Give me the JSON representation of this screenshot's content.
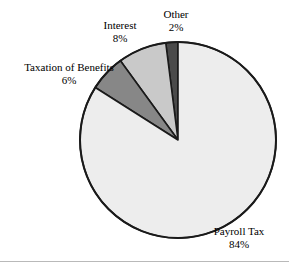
{
  "chart_data": {
    "type": "pie",
    "title": "",
    "subtitle": "",
    "xlabel": "",
    "ylabel": "",
    "legend_position": "none",
    "grid": false,
    "labels_outside": true,
    "start_angle_deg": 90,
    "direction": "counterclockwise",
    "categories": [
      "Other",
      "Interest",
      "Taxation of Benefits",
      "Payroll Tax"
    ],
    "values": [
      2,
      8,
      6,
      84
    ],
    "value_unit": "%",
    "slices": [
      {
        "name": "Other",
        "value": 2,
        "value_text": "2%",
        "color": "#4a4a4a",
        "start_deg": 90,
        "end_deg": 97.2
      },
      {
        "name": "Interest",
        "value": 8,
        "value_text": "8%",
        "color": "#c9c9c9",
        "start_deg": 97.2,
        "end_deg": 126.0
      },
      {
        "name": "Taxation of Benefits",
        "value": 6,
        "value_text": "6%",
        "color": "#878787",
        "start_deg": 126.0,
        "end_deg": 147.6
      },
      {
        "name": "Payroll Tax",
        "value": 84,
        "value_text": "84%",
        "color": "#ededed",
        "start_deg": 147.6,
        "end_deg": 450.0
      }
    ],
    "outline_color": "#1a1a1a",
    "background": "#ffffff"
  },
  "labels": {
    "taxation": {
      "name": "Taxation of Benefits",
      "value": "6%"
    },
    "interest": {
      "name": "Interest",
      "value": "8%"
    },
    "other": {
      "name": "Other",
      "value": "2%"
    },
    "payroll": {
      "name": "Payroll Tax",
      "value": "84%"
    }
  },
  "figure": {
    "width": 289,
    "height": 267,
    "center_x": 178,
    "center_y": 140,
    "radius": 98
  }
}
